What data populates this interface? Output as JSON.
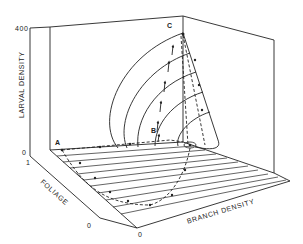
{
  "figure": {
    "type": "3d-phase-diagram",
    "axes": {
      "z": {
        "label": "LARVAL DENSITY",
        "ticks": [
          "0",
          "400"
        ]
      },
      "y": {
        "label": "FOLIAGE",
        "ticks": [
          "1",
          "0"
        ]
      },
      "x": {
        "label": "BRANCH DENSITY",
        "ticks": [
          "0"
        ]
      }
    },
    "points": [
      {
        "label": "A"
      },
      {
        "label": "B"
      },
      {
        "label": "C"
      }
    ],
    "colors": {
      "line": "#222222",
      "background": "#ffffff"
    }
  }
}
